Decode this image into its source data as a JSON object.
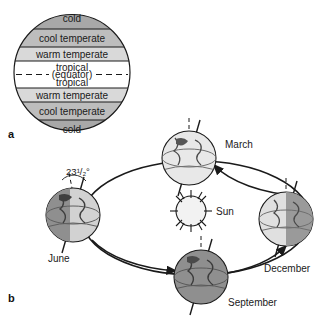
{
  "figure": {
    "background": "#ffffff",
    "panels": [
      {
        "letter": "a",
        "name": "climate-zones-panel"
      },
      {
        "letter": "b",
        "name": "earth-orbit-panel"
      }
    ]
  },
  "panel_a": {
    "title_letter": "a",
    "equator_label": "(equator)",
    "bands": [
      {
        "label": "cold",
        "fill": "#a8a8a8"
      },
      {
        "label": "cool temperate",
        "fill": "#bdbdbd"
      },
      {
        "label": "warm temperate",
        "fill": "#d9d9d9"
      },
      {
        "label": "tropical",
        "fill": "#ffffff"
      },
      {
        "label": "tropical",
        "fill": "#ffffff"
      },
      {
        "label": "warm temperate",
        "fill": "#d9d9d9"
      },
      {
        "label": "cool temperate",
        "fill": "#bdbdbd"
      },
      {
        "label": "cold",
        "fill": "#a8a8a8"
      }
    ]
  },
  "panel_b": {
    "title_letter": "b",
    "sun_label": "Sun",
    "tilt_label": "23¹/₂°",
    "tilt_degrees": "23.5",
    "orbit_direction": "counterclockwise",
    "positions": [
      {
        "label": "March",
        "name": "earth-march",
        "shade": "light"
      },
      {
        "label": "December",
        "name": "earth-december",
        "shade": "medium"
      },
      {
        "label": "September",
        "name": "earth-september",
        "shade": "dark"
      },
      {
        "label": "June",
        "name": "earth-june",
        "shade": "medium"
      }
    ]
  },
  "colors": {
    "line": "#1a1a1a",
    "globe_light": "#e8e8e8",
    "globe_medium": "#b0b0b0",
    "globe_dark": "#8a8a8a",
    "sun_fill": "#f2f2f2"
  }
}
